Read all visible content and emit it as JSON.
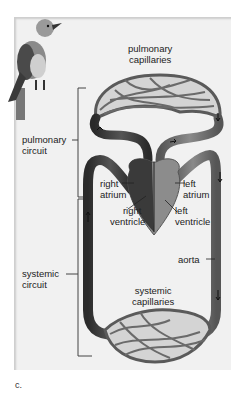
{
  "figure": {
    "panel_label": "c.",
    "subject_icon": "bird-icon",
    "labels": {
      "pulmonary_capillaries": [
        "pulmonary",
        "capillaries"
      ],
      "pulmonary_circuit": [
        "pulmonary",
        "circuit"
      ],
      "right_atrium": [
        "right",
        "atrium"
      ],
      "left_atrium": [
        "left",
        "atrium"
      ],
      "right_ventricle": [
        "right",
        "ventricle"
      ],
      "left_ventricle": [
        "left",
        "ventricle"
      ],
      "aorta": "aorta",
      "systemic_circuit": [
        "systemic",
        "circuit"
      ],
      "systemic_capillaries": [
        "systemic",
        "capillaries"
      ]
    },
    "colors": {
      "panel_bg": "#f1f1f1",
      "vessel_dark": "#3a3a3a",
      "vessel_mid": "#6e6e6e",
      "capillary_fill": "#d8d8d8",
      "text": "#222222"
    }
  }
}
